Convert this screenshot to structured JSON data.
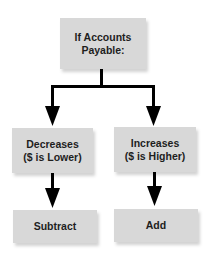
{
  "diagram": {
    "type": "flowchart",
    "colors": {
      "box_fill": "#d8d8d8",
      "text": "#1e1e1e",
      "arrow": "#000000",
      "background": "#ffffff"
    },
    "root": {
      "line1": "If Accounts",
      "line2": "Payable:"
    },
    "branches": [
      {
        "condition_line1": "Decreases",
        "condition_line2": "($ is Lower)",
        "action": "Subtract"
      },
      {
        "condition_line1": "Increases",
        "condition_line2": "($ is Higher)",
        "action": "Add"
      }
    ]
  }
}
